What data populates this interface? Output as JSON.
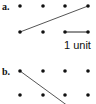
{
  "figure": {
    "parts": [
      {
        "label": "a.",
        "dot_grid": {
          "rows": 2,
          "cols": 4
        },
        "segment": {
          "from": [
            0,
            1
          ],
          "to": [
            3,
            0
          ],
          "description": "diagonal from bottom-left dot to top-right dot"
        },
        "scale_bar": {
          "from": [
            2,
            1
          ],
          "to": [
            3,
            1
          ],
          "text": "1 unit"
        }
      },
      {
        "label": "b.",
        "dot_grid": {
          "rows": 2,
          "cols": 4
        },
        "segment": {
          "from": [
            0,
            0
          ],
          "description": "diagonal from top-left dot heading down-right, extending beyond the grid"
        }
      }
    ],
    "colors": {
      "dot": "#111111",
      "line": "#555555"
    }
  }
}
